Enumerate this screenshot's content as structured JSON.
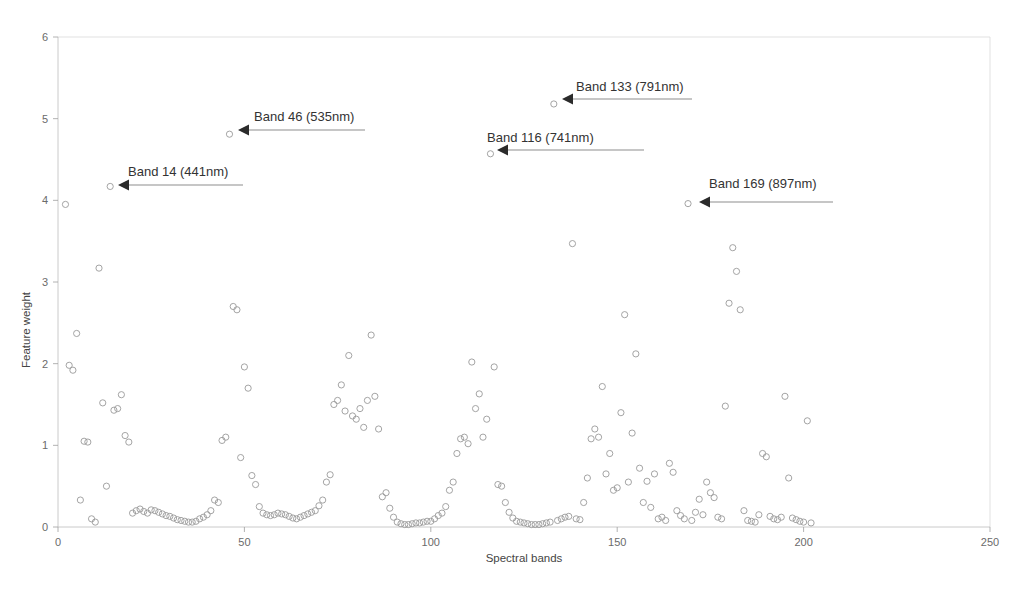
{
  "chart_data": {
    "type": "scatter",
    "title": "",
    "xlabel": "Spectral bands",
    "ylabel": "Feature weight",
    "xlim": [
      0,
      250
    ],
    "ylim": [
      0,
      6
    ],
    "xticks": [
      0,
      50,
      100,
      150,
      200,
      250
    ],
    "yticks": [
      0,
      1,
      2,
      3,
      4,
      5,
      6
    ],
    "xtick_labels": [
      "0",
      "50",
      "100",
      "150",
      "200",
      "250"
    ],
    "ytick_labels": [
      "0",
      "1",
      "2",
      "3",
      "4",
      "5",
      "6"
    ],
    "grid": false,
    "legend": "none",
    "marker": "open-circle",
    "marker_color": "#9a9a9a",
    "series": [
      {
        "name": "Feature weight per band",
        "points": [
          [
            2,
            3.95
          ],
          [
            3,
            1.98
          ],
          [
            4,
            1.92
          ],
          [
            5,
            2.37
          ],
          [
            6,
            0.33
          ],
          [
            7,
            1.05
          ],
          [
            8,
            1.04
          ],
          [
            9,
            0.1
          ],
          [
            10,
            0.06
          ],
          [
            11,
            3.17
          ],
          [
            12,
            1.52
          ],
          [
            13,
            0.5
          ],
          [
            14,
            4.17
          ],
          [
            15,
            1.43
          ],
          [
            16,
            1.45
          ],
          [
            17,
            1.62
          ],
          [
            18,
            1.12
          ],
          [
            19,
            1.04
          ],
          [
            20,
            0.17
          ],
          [
            21,
            0.2
          ],
          [
            22,
            0.22
          ],
          [
            23,
            0.19
          ],
          [
            24,
            0.17
          ],
          [
            25,
            0.21
          ],
          [
            26,
            0.2
          ],
          [
            27,
            0.18
          ],
          [
            28,
            0.16
          ],
          [
            29,
            0.14
          ],
          [
            30,
            0.13
          ],
          [
            31,
            0.11
          ],
          [
            32,
            0.09
          ],
          [
            33,
            0.08
          ],
          [
            34,
            0.07
          ],
          [
            35,
            0.06
          ],
          [
            36,
            0.06
          ],
          [
            37,
            0.07
          ],
          [
            38,
            0.1
          ],
          [
            39,
            0.12
          ],
          [
            40,
            0.15
          ],
          [
            41,
            0.2
          ],
          [
            42,
            0.33
          ],
          [
            43,
            0.3
          ],
          [
            44,
            1.06
          ],
          [
            45,
            1.1
          ],
          [
            46,
            4.81
          ],
          [
            47,
            2.7
          ],
          [
            48,
            2.66
          ],
          [
            49,
            0.85
          ],
          [
            50,
            1.96
          ],
          [
            51,
            1.7
          ],
          [
            52,
            0.63
          ],
          [
            53,
            0.52
          ],
          [
            54,
            0.25
          ],
          [
            55,
            0.17
          ],
          [
            56,
            0.15
          ],
          [
            57,
            0.14
          ],
          [
            58,
            0.15
          ],
          [
            59,
            0.17
          ],
          [
            60,
            0.16
          ],
          [
            61,
            0.15
          ],
          [
            62,
            0.13
          ],
          [
            63,
            0.11
          ],
          [
            64,
            0.1
          ],
          [
            65,
            0.12
          ],
          [
            66,
            0.14
          ],
          [
            67,
            0.16
          ],
          [
            68,
            0.18
          ],
          [
            69,
            0.2
          ],
          [
            70,
            0.26
          ],
          [
            71,
            0.33
          ],
          [
            72,
            0.55
          ],
          [
            73,
            0.64
          ],
          [
            74,
            1.5
          ],
          [
            75,
            1.55
          ],
          [
            76,
            1.74
          ],
          [
            77,
            1.42
          ],
          [
            78,
            2.1
          ],
          [
            79,
            1.36
          ],
          [
            80,
            1.32
          ],
          [
            81,
            1.45
          ],
          [
            82,
            1.22
          ],
          [
            83,
            1.55
          ],
          [
            84,
            2.35
          ],
          [
            85,
            1.6
          ],
          [
            86,
            1.2
          ],
          [
            87,
            0.37
          ],
          [
            88,
            0.42
          ],
          [
            89,
            0.23
          ],
          [
            90,
            0.12
          ],
          [
            91,
            0.06
          ],
          [
            92,
            0.04
          ],
          [
            93,
            0.03
          ],
          [
            94,
            0.03
          ],
          [
            95,
            0.04
          ],
          [
            96,
            0.05
          ],
          [
            97,
            0.05
          ],
          [
            98,
            0.06
          ],
          [
            99,
            0.07
          ],
          [
            100,
            0.07
          ],
          [
            101,
            0.1
          ],
          [
            102,
            0.14
          ],
          [
            103,
            0.17
          ],
          [
            104,
            0.25
          ],
          [
            105,
            0.45
          ],
          [
            106,
            0.55
          ],
          [
            107,
            0.9
          ],
          [
            108,
            1.08
          ],
          [
            109,
            1.1
          ],
          [
            110,
            1.02
          ],
          [
            111,
            2.02
          ],
          [
            112,
            1.45
          ],
          [
            113,
            1.63
          ],
          [
            114,
            1.1
          ],
          [
            115,
            1.32
          ],
          [
            116,
            4.57
          ],
          [
            117,
            1.96
          ],
          [
            118,
            0.52
          ],
          [
            119,
            0.5
          ],
          [
            120,
            0.3
          ],
          [
            121,
            0.18
          ],
          [
            122,
            0.11
          ],
          [
            123,
            0.07
          ],
          [
            124,
            0.06
          ],
          [
            125,
            0.05
          ],
          [
            126,
            0.04
          ],
          [
            127,
            0.03
          ],
          [
            128,
            0.03
          ],
          [
            129,
            0.03
          ],
          [
            130,
            0.04
          ],
          [
            131,
            0.05
          ],
          [
            132,
            0.06
          ],
          [
            133,
            5.18
          ],
          [
            134,
            0.08
          ],
          [
            135,
            0.1
          ],
          [
            136,
            0.12
          ],
          [
            137,
            0.13
          ],
          [
            138,
            3.47
          ],
          [
            139,
            0.1
          ],
          [
            140,
            0.09
          ],
          [
            141,
            0.3
          ],
          [
            142,
            0.6
          ],
          [
            143,
            1.08
          ],
          [
            144,
            1.2
          ],
          [
            145,
            1.1
          ],
          [
            146,
            1.72
          ],
          [
            147,
            0.65
          ],
          [
            148,
            0.9
          ],
          [
            149,
            0.45
          ],
          [
            150,
            0.48
          ],
          [
            151,
            1.4
          ],
          [
            152,
            2.6
          ],
          [
            153,
            0.55
          ],
          [
            154,
            1.15
          ],
          [
            155,
            2.12
          ],
          [
            156,
            0.72
          ],
          [
            157,
            0.3
          ],
          [
            158,
            0.56
          ],
          [
            159,
            0.24
          ],
          [
            160,
            0.65
          ],
          [
            161,
            0.1
          ],
          [
            162,
            0.12
          ],
          [
            163,
            0.08
          ],
          [
            164,
            0.78
          ],
          [
            165,
            0.67
          ],
          [
            166,
            0.2
          ],
          [
            167,
            0.14
          ],
          [
            168,
            0.1
          ],
          [
            169,
            3.96
          ],
          [
            170,
            0.08
          ],
          [
            171,
            0.18
          ],
          [
            172,
            0.34
          ],
          [
            173,
            0.15
          ],
          [
            174,
            0.55
          ],
          [
            175,
            0.42
          ],
          [
            176,
            0.36
          ],
          [
            177,
            0.12
          ],
          [
            178,
            0.1
          ],
          [
            179,
            1.48
          ],
          [
            180,
            2.74
          ],
          [
            181,
            3.42
          ],
          [
            182,
            3.13
          ],
          [
            183,
            2.66
          ],
          [
            184,
            0.2
          ],
          [
            185,
            0.08
          ],
          [
            186,
            0.07
          ],
          [
            187,
            0.06
          ],
          [
            188,
            0.15
          ],
          [
            189,
            0.9
          ],
          [
            190,
            0.86
          ],
          [
            191,
            0.13
          ],
          [
            192,
            0.1
          ],
          [
            193,
            0.09
          ],
          [
            194,
            0.12
          ],
          [
            195,
            1.6
          ],
          [
            196,
            0.6
          ],
          [
            197,
            0.11
          ],
          [
            198,
            0.09
          ],
          [
            199,
            0.07
          ],
          [
            200,
            0.06
          ],
          [
            201,
            1.3
          ],
          [
            202,
            0.05
          ]
        ]
      }
    ],
    "annotations": [
      {
        "label": "Band 14 (441nm)",
        "band": 14,
        "wavelength_nm": 441,
        "point": [
          14,
          4.17
        ],
        "text_x": 128,
        "text_y": 176,
        "arrow_from_x": 243,
        "arrow_to_x": 118,
        "arrow_y": 185
      },
      {
        "label": "Band 46 (535nm)",
        "band": 46,
        "wavelength_nm": 535,
        "point": [
          46,
          4.81
        ],
        "text_x": 254,
        "text_y": 121,
        "arrow_from_x": 365,
        "arrow_to_x": 238,
        "arrow_y": 130
      },
      {
        "label": "Band 133 (791nm)",
        "band": 133,
        "wavelength_nm": 791,
        "point": [
          133,
          5.18
        ],
        "text_x": 576,
        "text_y": 91,
        "arrow_from_x": 692,
        "arrow_to_x": 562,
        "arrow_y": 99
      },
      {
        "label": "Band 116 (741nm)",
        "band": 116,
        "wavelength_nm": 741,
        "point": [
          116,
          4.57
        ],
        "text_x": 487,
        "text_y": 142,
        "arrow_from_x": 644,
        "arrow_to_x": 497,
        "arrow_y": 150
      },
      {
        "label": "Band 169 (897nm)",
        "band": 169,
        "wavelength_nm": 897,
        "point": [
          169,
          3.96
        ],
        "text_x": 709,
        "text_y": 188,
        "arrow_from_x": 833,
        "arrow_to_x": 699,
        "arrow_y": 202
      }
    ]
  },
  "figure": {
    "background_color": "#ffffff",
    "frame_color": "#d9d9d9",
    "marker_stroke": "#9a9a9a",
    "annotation_text_color": "#333333"
  }
}
